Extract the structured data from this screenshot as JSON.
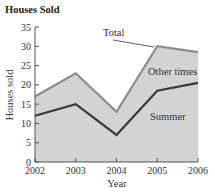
{
  "chart_data": {
    "type": "area",
    "title": "Houses Sold",
    "xlabel": "Year",
    "ylabel": "Houses sold",
    "categories": [
      "2002",
      "2003",
      "2004",
      "2005",
      "2006"
    ],
    "x": [
      2002,
      2003,
      2004,
      2005,
      2006
    ],
    "series": [
      {
        "name": "Total",
        "values": [
          17,
          23,
          13,
          30,
          28.5
        ]
      },
      {
        "name": "Summer",
        "values": [
          12,
          15,
          7,
          18.5,
          20.5
        ]
      },
      {
        "name": "Other times",
        "values": [
          5,
          8,
          6,
          11.5,
          8
        ]
      }
    ],
    "annotations": [
      "Total",
      "Other times",
      "Summer"
    ],
    "ylim": [
      0,
      35
    ],
    "yticks": [
      0,
      5,
      10,
      15,
      20,
      25,
      30,
      35
    ],
    "xticks": [
      2002,
      2003,
      2004,
      2005,
      2006
    ],
    "grid": false,
    "legend": "none (inline labels)",
    "colors": {
      "fill": "#d3d3d3",
      "total_line": "#8c8c8c",
      "summer_line": "#3a3a3a",
      "axis": "#555555"
    }
  }
}
